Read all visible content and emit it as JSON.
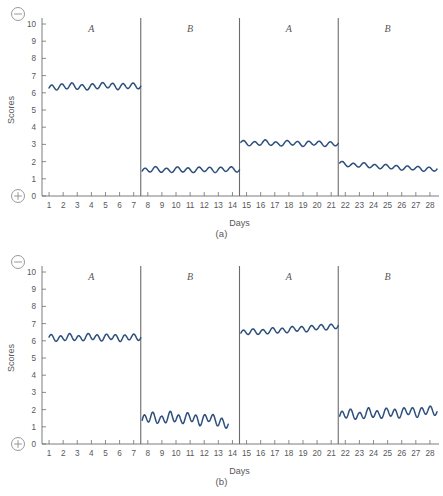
{
  "figure": {
    "panels": [
      {
        "id": "a",
        "caption": "(a)",
        "xlabel": "Days",
        "ylabel": "Scores",
        "top_sign": "minus-in-circle",
        "bottom_sign": "plus-in-circle"
      },
      {
        "id": "b",
        "caption": "(b)",
        "xlabel": "Days",
        "ylabel": "Scores",
        "top_sign": "minus-in-circle",
        "bottom_sign": "plus-in-circle"
      }
    ]
  },
  "chart_data": [
    {
      "type": "line",
      "title": "(a)",
      "xlabel": "Days",
      "ylabel": "Scores",
      "xlim": [
        0.5,
        28.5
      ],
      "ylim": [
        0,
        10
      ],
      "yticks": [
        0,
        1,
        2,
        3,
        4,
        5,
        6,
        7,
        8,
        9,
        10
      ],
      "xticks": [
        1,
        2,
        3,
        4,
        5,
        6,
        7,
        8,
        9,
        10,
        11,
        12,
        13,
        14,
        15,
        16,
        17,
        18,
        19,
        20,
        21,
        22,
        23,
        24,
        25,
        26,
        27,
        28
      ],
      "grid": false,
      "legend": "none",
      "line_color": "#2d4f7c",
      "axis_direction_markers": {
        "top": "−",
        "bottom": "+"
      },
      "phase_dividers": [
        7.5,
        14.5,
        21.5
      ],
      "phases": [
        {
          "label": "A",
          "label_x": 4,
          "x_start": 1,
          "x_end": 7.5,
          "level_start": 6.25,
          "level_end": 6.4,
          "amplitude": 0.16,
          "cycles": 9,
          "values": [
            6.28,
            6.35,
            6.42,
            6.3,
            6.38,
            6.46,
            6.34,
            6.42,
            6.38
          ]
        },
        {
          "label": "B",
          "label_x": 11,
          "x_start": 7.6,
          "x_end": 14.5,
          "level_start": 1.45,
          "level_end": 1.55,
          "amplitude": 0.14,
          "cycles": 9,
          "values": [
            1.45,
            1.58,
            1.47,
            1.56,
            1.48,
            1.57,
            1.5,
            1.58,
            1.52
          ]
        },
        {
          "label": "A",
          "label_x": 18,
          "x_start": 14.6,
          "x_end": 21.5,
          "level_start": 3.12,
          "level_end": 3.05,
          "amplitude": 0.13,
          "cycles": 9,
          "values": [
            3.12,
            3.02,
            3.14,
            3.0,
            3.12,
            3.0,
            3.1,
            3.0,
            3.06
          ]
        },
        {
          "label": "B",
          "label_x": 25,
          "x_start": 21.6,
          "x_end": 28.5,
          "level_start": 1.92,
          "level_end": 1.55,
          "amplitude": 0.12,
          "cycles": 9,
          "values": [
            1.92,
            1.78,
            1.82,
            1.7,
            1.72,
            1.62,
            1.64,
            1.55,
            1.57
          ]
        }
      ]
    },
    {
      "type": "line",
      "title": "(b)",
      "xlabel": "Days",
      "ylabel": "Scores",
      "xlim": [
        0.5,
        28.5
      ],
      "ylim": [
        0,
        10
      ],
      "yticks": [
        0,
        1,
        2,
        3,
        4,
        5,
        6,
        7,
        8,
        9,
        10
      ],
      "xticks": [
        1,
        2,
        3,
        4,
        5,
        6,
        7,
        8,
        9,
        10,
        11,
        12,
        13,
        14,
        15,
        16,
        17,
        18,
        19,
        20,
        21,
        22,
        23,
        24,
        25,
        26,
        27,
        28
      ],
      "grid": false,
      "legend": "none",
      "line_color": "#2d4f7c",
      "axis_direction_markers": {
        "top": "−",
        "bottom": "+"
      },
      "phase_dividers": [
        7.5,
        14.5,
        21.5
      ],
      "phases": [
        {
          "label": "A",
          "label_x": 4,
          "x_start": 1,
          "x_end": 7.5,
          "level_start": 6.2,
          "level_end": 6.2,
          "amplitude": 0.17,
          "cycles": 10,
          "values": [
            6.22,
            6.1,
            6.26,
            6.12,
            6.28,
            6.14,
            6.26,
            6.12,
            6.24,
            6.18
          ]
        },
        {
          "label": "B",
          "label_x": 11,
          "x_start": 7.6,
          "x_end": 13.7,
          "level_start": 1.38,
          "level_end": 1.15,
          "amplitude": 0.26,
          "cycles": 10,
          "values": [
            1.38,
            1.62,
            1.35,
            1.66,
            1.38,
            1.62,
            1.3,
            1.58,
            1.28,
            1.15
          ]
        },
        {
          "label": "A",
          "label_x": 18,
          "x_start": 14.6,
          "x_end": 21.5,
          "level_start": 6.45,
          "level_end": 6.9,
          "amplitude": 0.15,
          "cycles": 10,
          "values": [
            6.45,
            6.55,
            6.5,
            6.62,
            6.58,
            6.72,
            6.66,
            6.8,
            6.78,
            6.88
          ]
        },
        {
          "label": "B",
          "label_x": 25,
          "x_start": 21.6,
          "x_end": 28.5,
          "level_start": 1.65,
          "level_end": 1.92,
          "amplitude": 0.24,
          "cycles": 11,
          "values": [
            1.62,
            1.82,
            1.58,
            1.88,
            1.66,
            1.9,
            1.72,
            1.96,
            1.78,
            2.0,
            1.88
          ]
        }
      ]
    }
  ]
}
